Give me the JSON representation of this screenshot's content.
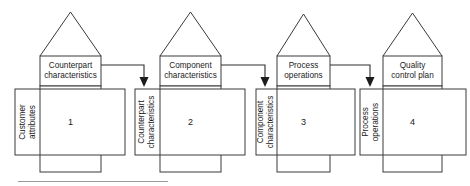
{
  "diagram": {
    "type": "qfd-four-phase-house-of-quality",
    "width": 470,
    "height": 186,
    "background_color": "#ffffff",
    "line_color": "#3a3a3a",
    "text_color": "#1a1a1a",
    "bottom_rule_color": "#9a9a9a",
    "houses": [
      {
        "index": 1,
        "number": "1",
        "roof_label": "Counterpart\ncharacteristics",
        "side_label": "Customer\nattributes",
        "roof_line1": "Counterpart",
        "roof_line2": "characteristics",
        "side_line1": "Customer",
        "side_line2": "attributes"
      },
      {
        "index": 2,
        "number": "2",
        "roof_label": "Component\ncharacteristics",
        "side_label": "Counterpart\ncharacteristics",
        "roof_line1": "Component",
        "roof_line2": "characteristics",
        "side_line1": "Counterpart",
        "side_line2": "characteristics"
      },
      {
        "index": 3,
        "number": "3",
        "roof_label": "Process\noperations",
        "side_label": "Component\ncharacteristics",
        "roof_line1": "Process",
        "roof_line2": "operations",
        "side_line1": "Component",
        "side_line2": "characteristics"
      },
      {
        "index": 4,
        "number": "4",
        "roof_label": "Quality\ncontrol plan",
        "side_label": "Process\noperations",
        "roof_line1": "Quality",
        "roof_line2": "control plan",
        "side_line1": "Process",
        "side_line2": "operations"
      }
    ],
    "connectors": [
      {
        "from_house": 1,
        "to_house": 2,
        "shape": "right-then-down",
        "arrow": "down"
      },
      {
        "from_house": 2,
        "to_house": 3,
        "shape": "right-then-down",
        "arrow": "down"
      },
      {
        "from_house": 3,
        "to_house": 4,
        "shape": "right-then-down",
        "arrow": "down"
      }
    ]
  }
}
